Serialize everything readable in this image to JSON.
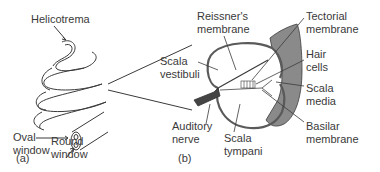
{
  "figure": {
    "panel_a": {
      "tag": "(a)",
      "labels": {
        "helicotrema": "Helicotrema",
        "oval_window": "Oval\nwindow",
        "round_window": "Round\nwindow"
      }
    },
    "panel_b": {
      "tag": "(b)",
      "labels": {
        "reissners_membrane": "Reissner's\nmembrane",
        "tectorial_membrane": "Tectorial\nmembrane",
        "hair_cells": "Hair\ncells",
        "scala_vestibuli": "Scala\nvestibuli",
        "scala_media": "Scala\nmedia",
        "basilar_membrane": "Basilar\nmembrane",
        "auditory_nerve": "Auditory\nnerve",
        "scala_tympani": "Scala\ntympani"
      }
    },
    "colors": {
      "line": "#3a3a3a",
      "wall_fill": "#8a8a8a",
      "nerve_fill": "#444444",
      "background": "#ffffff"
    }
  }
}
